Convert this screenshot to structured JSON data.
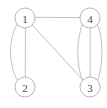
{
  "figure": {
    "kind": "graph-diagram",
    "background_color": "#ffffff",
    "edge_color": "#b9b9b9",
    "node_fill_color": "#ffffff",
    "node_stroke_color": "#b0b0b0",
    "label_color": "#4a4a4a",
    "width": 107,
    "height": 108
  },
  "chart_data": {
    "type": "diagram",
    "title": "",
    "xlabel": "",
    "ylabel": "",
    "nodes": [
      {
        "id": "1",
        "label": "1",
        "x": 25,
        "y": 18,
        "r": 10
      },
      {
        "id": "4",
        "label": "4",
        "x": 90,
        "y": 18,
        "r": 10
      },
      {
        "id": "2",
        "label": "2",
        "x": 25,
        "y": 87,
        "r": 10
      },
      {
        "id": "3",
        "label": "3",
        "x": 90,
        "y": 87,
        "r": 10
      }
    ],
    "edges": [
      {
        "from": "1",
        "to": "4",
        "shape": "straight",
        "path": "M 35.2 17.3 L 79.8 17.6"
      },
      {
        "from": "1",
        "to": "2",
        "shape": "straight",
        "path": "M 25.4 28.1 L 25.3 76.8"
      },
      {
        "from": "1",
        "to": "2",
        "shape": "curved-left",
        "path": "M 17.0 24.5 C 8.0 40.0 8.5 64.0 17.4 80.6"
      },
      {
        "from": "1",
        "to": "3",
        "shape": "straight",
        "path": "M 32.6 25.3 L 82.6 79.7"
      },
      {
        "from": "4",
        "to": "3",
        "shape": "straight",
        "path": "M 90.2 28.1 L 90.1 76.8"
      },
      {
        "from": "4",
        "to": "3",
        "shape": "curved-left",
        "path": "M 82.4 24.2 C 76.0 42.0 76.2 63.0 82.5 80.8"
      },
      {
        "from": "4",
        "to": "3",
        "shape": "curved-right",
        "path": "M 97.6 24.2 C 103.6 42.0 103.4 63.0 97.5 80.8"
      }
    ]
  }
}
